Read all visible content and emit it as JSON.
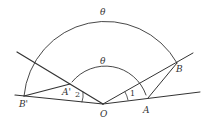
{
  "diagram": {
    "stroke_color": "#333333",
    "background": "#ffffff",
    "points": {
      "O": {
        "label": "O",
        "x": 103,
        "y": 104
      },
      "A": {
        "label": "A",
        "x": 148,
        "y": 98
      },
      "B": {
        "label": "B",
        "x": 177,
        "y": 63
      },
      "A_prime": {
        "label": "A'",
        "x": 70,
        "y": 84
      },
      "B_prime": {
        "label": "B'",
        "x": 24,
        "y": 96
      }
    },
    "angle_labels": {
      "outer_theta": "θ",
      "inner_theta": "θ",
      "angle_1": "1",
      "angle_2": "2"
    },
    "segments": [
      {
        "from": "O",
        "to": "ray_right_end",
        "desc": "ray O through A"
      },
      {
        "from": "O",
        "to": "ray_upright_end",
        "desc": "ray O through B"
      },
      {
        "from": "O",
        "to": "ray_upleft_end",
        "desc": "ray O through A'"
      },
      {
        "from": "O",
        "to": "ray_left_end",
        "desc": "ray O through B'"
      },
      {
        "from": "A",
        "to": "B"
      },
      {
        "from": "A_prime",
        "to": "B_prime"
      }
    ],
    "arcs": [
      {
        "name": "outer-arc",
        "center": "O",
        "from": "B",
        "to": "B_prime",
        "label": "θ"
      },
      {
        "name": "inner-arc",
        "center": "O",
        "from": "A",
        "to": "A_prime",
        "label": "θ"
      }
    ]
  }
}
